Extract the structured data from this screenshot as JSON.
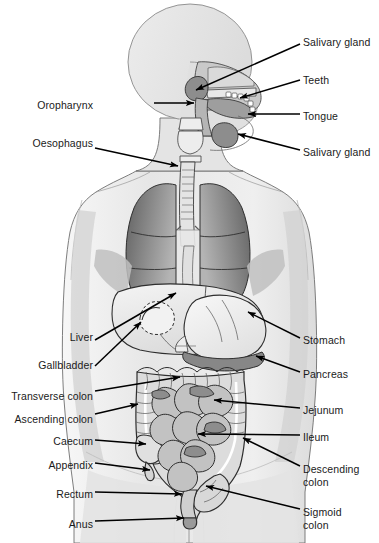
{
  "figure": {
    "width": 379,
    "height": 543,
    "type": "labelled-anatomy-diagram",
    "background_color": "#ffffff",
    "line_color": "#000000",
    "palette": {
      "body_fill": "#e9e9e9",
      "body_fill_light": "#f2f2f2",
      "organ_light": "#ededed",
      "organ_mid": "#b9b9b9",
      "organ_dark": "#8a8a8a",
      "lung_dark": "#6e6e6e",
      "outline": "#1a1a1a"
    }
  },
  "labels": {
    "left": [
      {
        "id": "oropharynx",
        "text": "Oropharynx",
        "x": 93,
        "y": 99
      },
      {
        "id": "oesophagus",
        "text": "Oesophagus",
        "x": 93,
        "y": 137
      },
      {
        "id": "liver",
        "text": "Liver",
        "x": 93,
        "y": 331
      },
      {
        "id": "gallbladder",
        "text": "Gallbladder",
        "x": 93,
        "y": 359
      },
      {
        "id": "transverse-colon",
        "text": "Transverse colon",
        "x": 93,
        "y": 390
      },
      {
        "id": "ascending-colon",
        "text": "Ascending colon",
        "x": 93,
        "y": 413
      },
      {
        "id": "caecum",
        "text": "Caecum",
        "x": 93,
        "y": 435
      },
      {
        "id": "appendix",
        "text": "Appendix",
        "x": 93,
        "y": 459
      },
      {
        "id": "rectum",
        "text": "Rectum",
        "x": 93,
        "y": 488
      },
      {
        "id": "anus",
        "text": "Anus",
        "x": 93,
        "y": 518
      }
    ],
    "right": [
      {
        "id": "salivary-gland-upper",
        "text": "Salivary gland",
        "x": 303,
        "y": 36
      },
      {
        "id": "teeth",
        "text": "Teeth",
        "x": 303,
        "y": 74
      },
      {
        "id": "tongue",
        "text": "Tongue",
        "x": 303,
        "y": 110
      },
      {
        "id": "salivary-gland-lower",
        "text": "Salivary gland",
        "x": 303,
        "y": 146
      },
      {
        "id": "stomach",
        "text": "Stomach",
        "x": 303,
        "y": 334
      },
      {
        "id": "pancreas",
        "text": "Pancreas",
        "x": 303,
        "y": 368
      },
      {
        "id": "jejunum",
        "text": "Jejunum",
        "x": 303,
        "y": 404
      },
      {
        "id": "ileum",
        "text": "Ileum",
        "x": 303,
        "y": 431
      },
      {
        "id": "descending-colon",
        "text": "Descending\ncolon",
        "x": 303,
        "y": 463
      },
      {
        "id": "sigmoid-colon",
        "text": "Sigmoid\ncolon",
        "x": 303,
        "y": 506
      }
    ]
  },
  "leaders": {
    "description": "Arrow leader lines run from each label to the corresponding organ; filled triangular arrowheads point at the organ.",
    "count": 20
  },
  "organs": [
    "salivary gland (parotid)",
    "salivary gland (submandibular)",
    "teeth",
    "tongue",
    "oropharynx",
    "oesophagus",
    "trachea",
    "lungs",
    "liver",
    "gallbladder",
    "stomach",
    "pancreas",
    "transverse colon",
    "ascending colon",
    "descending colon",
    "sigmoid colon",
    "caecum",
    "appendix",
    "jejunum",
    "ileum",
    "rectum",
    "anus"
  ]
}
